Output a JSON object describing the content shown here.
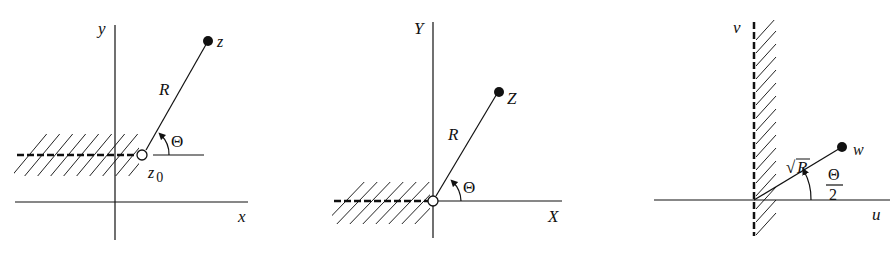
{
  "panels": [
    {
      "id": "z-plane",
      "axes": {
        "x_label": "x",
        "y_label": "y"
      },
      "point_label": "z",
      "branch_point_label": "z",
      "branch_point_subscript": "0",
      "radius_label": "R",
      "angle_label": "Θ"
    },
    {
      "id": "Z-plane",
      "axes": {
        "x_label": "X",
        "y_label": "Y"
      },
      "point_label": "Z",
      "radius_label": "R",
      "angle_label": "Θ"
    },
    {
      "id": "w-plane",
      "axes": {
        "x_label": "u",
        "y_label": "v"
      },
      "point_label": "w",
      "radius_label_root": "√",
      "radius_label": "R",
      "angle_numerator": "Θ",
      "angle_denominator": "2"
    }
  ]
}
